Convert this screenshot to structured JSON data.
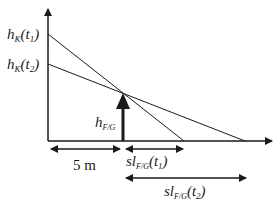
{
  "diagram": {
    "colors": {
      "stroke": "#1a1a1a",
      "background": "#ffffff"
    },
    "labels": {
      "hk_t1": {
        "main": "h",
        "sub": "K",
        "arg": "(t",
        "argsub": "1",
        "close": ")"
      },
      "hk_t2": {
        "main": "h",
        "sub": "K",
        "arg": "(t",
        "argsub": "2",
        "close": ")"
      },
      "hfg": {
        "main": "h",
        "sub": "F/G"
      },
      "dist": "5 m",
      "sl_t1": {
        "main": "sl",
        "sub": "F/G",
        "arg": "(t",
        "argsub": "1",
        "close": ")"
      },
      "sl_t2": {
        "main": "sl",
        "sub": "F/G",
        "arg": "(t",
        "argsub": "2",
        "close": ")"
      }
    }
  }
}
